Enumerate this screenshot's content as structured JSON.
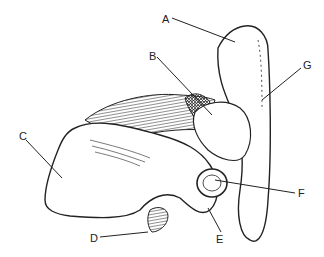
{
  "diagram": {
    "labels": [
      {
        "id": "A",
        "text": "A",
        "x": 162,
        "y": 14
      },
      {
        "id": "B",
        "text": "B",
        "x": 149,
        "y": 51
      },
      {
        "id": "C",
        "text": "C",
        "x": 19,
        "y": 136
      },
      {
        "id": "D",
        "text": "D",
        "x": 92,
        "y": 234
      },
      {
        "id": "E",
        "text": "E",
        "x": 218,
        "y": 236
      },
      {
        "id": "F",
        "text": "F",
        "x": 298,
        "y": 190
      },
      {
        "id": "G",
        "text": "G",
        "x": 304,
        "y": 63
      }
    ],
    "colors": {
      "ink": "#222222",
      "background": "#ffffff"
    }
  }
}
